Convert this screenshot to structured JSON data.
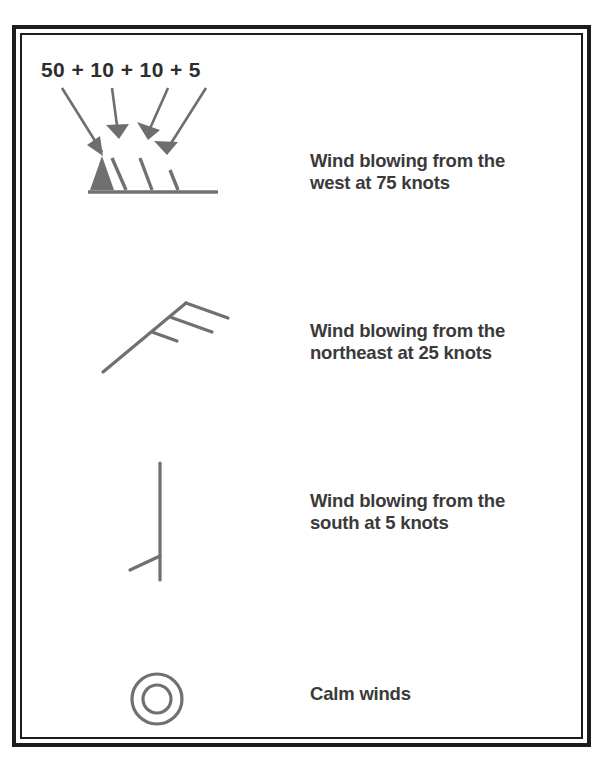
{
  "figure": {
    "annotation": {
      "formula": "50 + 10 + 10 + 5",
      "arrow_count": 4,
      "arrow_targets": [
        "pennant-50",
        "barb-10-first",
        "barb-10-second",
        "half-barb-5"
      ]
    },
    "colors": {
      "frame": "#1c1c1c",
      "symbol_stroke": "#707070",
      "pennant_fill": "#707070",
      "label_text": "#3a3a3a",
      "annotation_text": "#2e2e2e",
      "background": "#ffffff"
    },
    "rows": [
      {
        "id": "west",
        "symbol_name": "wind-barb-west-75-knots",
        "direction": "west",
        "speed_knots": 75,
        "components": {
          "pennants_50": 1,
          "full_barbs_10": 2,
          "half_barbs_5": 1
        },
        "label": "Wind blowing from the\nwest at 75 knots"
      },
      {
        "id": "northeast",
        "symbol_name": "wind-barb-northeast-25-knots",
        "direction": "northeast",
        "speed_knots": 25,
        "components": {
          "pennants_50": 0,
          "full_barbs_10": 2,
          "half_barbs_5": 1
        },
        "label": "Wind blowing from the\nnortheast at 25 knots"
      },
      {
        "id": "south",
        "symbol_name": "wind-barb-south-5-knots",
        "direction": "south",
        "speed_knots": 5,
        "components": {
          "pennants_50": 0,
          "full_barbs_10": 0,
          "half_barbs_5": 1
        },
        "label": "Wind blowing from the\nsouth at 5 knots"
      },
      {
        "id": "calm",
        "symbol_name": "calm-winds-circle",
        "direction": "none",
        "speed_knots": 0,
        "components": {
          "pennants_50": 0,
          "full_barbs_10": 0,
          "half_barbs_5": 0
        },
        "label": "Calm winds"
      }
    ]
  }
}
